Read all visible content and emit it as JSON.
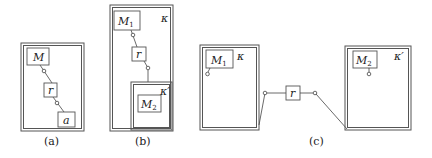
{
  "diagrams": {
    "a": {
      "caption": "(a)",
      "modules": {
        "m": "M",
        "r": "r",
        "a": "a"
      }
    },
    "b": {
      "caption": "(b)",
      "outer_context": "κ",
      "inner_context": "κ′",
      "modules": {
        "m1": "M",
        "m1_sub": "1",
        "r": "r",
        "m2": "M",
        "m2_sub": "2"
      }
    },
    "c": {
      "caption": "(c)",
      "left_context": "κ",
      "right_context": "κ′",
      "modules": {
        "m1": "M",
        "m1_sub": "1",
        "r": "r",
        "m2": "M",
        "m2_sub": "2"
      }
    }
  }
}
